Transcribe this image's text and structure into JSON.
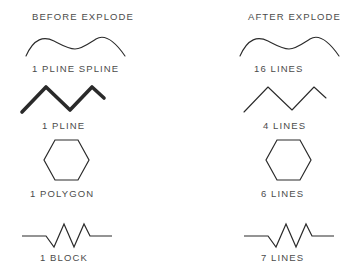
{
  "page": {
    "background_color": "#ffffff",
    "line_color": "#2a2a2a",
    "text_color": "#4b4b4b"
  },
  "headers": {
    "left": "BEFORE EXPLODE",
    "right": "AFTER EXPLODE"
  },
  "rows": [
    {
      "before_label": "1  PLINE  SPLINE",
      "after_label": "16  LINES",
      "shape": "wavy-spline",
      "before_weight": "thin",
      "after_weight": "thin"
    },
    {
      "before_label": "1  PLINE",
      "after_label": "4  LINES",
      "shape": "zigzag",
      "before_weight": "thick",
      "after_weight": "thin"
    },
    {
      "before_label": "1  POLYGON",
      "after_label": "6  LINES",
      "shape": "hexagon",
      "before_weight": "thin",
      "after_weight": "thin"
    },
    {
      "before_label": "1  BLOCK",
      "after_label": "7  LINES",
      "shape": "resistor",
      "before_weight": "thin",
      "after_weight": "thin"
    }
  ]
}
